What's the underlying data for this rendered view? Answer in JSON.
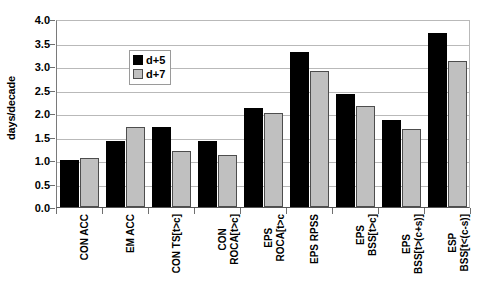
{
  "chart_data": {
    "type": "bar",
    "title": "",
    "xlabel": "",
    "ylabel": "days/decade",
    "ylim": [
      0.0,
      4.0
    ],
    "ytick_labels": [
      "4.0",
      "3.5",
      "3.0",
      "2.5",
      "2.0",
      "1.5",
      "1.0",
      "0.5",
      "0.0"
    ],
    "ytick_values": [
      4.0,
      3.5,
      3.0,
      2.5,
      2.0,
      1.5,
      1.0,
      0.5,
      0.0
    ],
    "grid": true,
    "legend_position": "upper-left-inside",
    "categories": [
      "CON ACC",
      "EM ACC",
      "CON TS[t>c]",
      "CON ROCA[t>c]",
      "EPS ROCA[t>c",
      "EPS RPSS",
      "EPS BSS[t>c]",
      "EPS BSS[t>(c+s)]",
      "ESP BSS[t<(c-s)]"
    ],
    "category_lines": [
      [
        "CON ACC"
      ],
      [
        "EM ACC"
      ],
      [
        "CON TS[t>c]"
      ],
      [
        "CON",
        "ROCA[t>c]"
      ],
      [
        "EPS",
        "ROCA[t>c"
      ],
      [
        "EPS RPSS"
      ],
      [
        "EPS",
        "BSS[t>c]"
      ],
      [
        "EPS",
        "BSS[t>(c+s)]"
      ],
      [
        "ESP",
        "BSS[t<(c-s)]"
      ]
    ],
    "series": [
      {
        "name": "d+5",
        "color": "#000000",
        "values": [
          1.0,
          1.4,
          1.7,
          1.4,
          2.1,
          3.3,
          2.4,
          1.85,
          3.7
        ]
      },
      {
        "name": "d+7",
        "color": "#c0c0c0",
        "values": [
          1.05,
          1.7,
          1.2,
          1.1,
          2.0,
          2.9,
          2.15,
          1.65,
          3.1
        ]
      }
    ]
  },
  "legend": {
    "items": [
      {
        "label": "d+5"
      },
      {
        "label": "d+7"
      }
    ]
  }
}
